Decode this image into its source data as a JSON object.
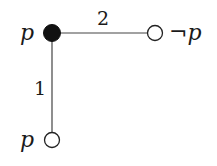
{
  "diagram": {
    "type": "graph",
    "nodes": [
      {
        "id": "n0",
        "label": "p",
        "filled": true
      },
      {
        "id": "n1",
        "label": "¬p",
        "filled": false
      },
      {
        "id": "n2",
        "label": "p",
        "filled": false
      }
    ],
    "edges": [
      {
        "from": "n0",
        "to": "n1",
        "label": "2"
      },
      {
        "from": "n0",
        "to": "n2",
        "label": "1"
      }
    ]
  },
  "colors": {
    "node_fill": "#111111",
    "stroke": "#333333",
    "background": "#ffffff"
  }
}
